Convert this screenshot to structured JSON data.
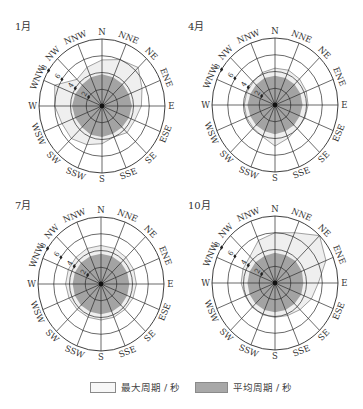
{
  "directions": [
    "N",
    "NNE",
    "NE",
    "ENE",
    "E",
    "ESE",
    "SE",
    "SSE",
    "S",
    "SSW",
    "SW",
    "WSW",
    "W",
    "WNW",
    "NW",
    "NNW"
  ],
  "ring_values": [
    2,
    4,
    6,
    8
  ],
  "colors": {
    "max_fill": "#efefef",
    "max_stroke": "#8a8a8a",
    "avg_fill": "#a3a3a3",
    "grid": "#2a2a2a",
    "legend_max": "#f7f7f7",
    "legend_avg": "#a8a8a8"
  },
  "legend": {
    "max_label": "最大周期 / 秒",
    "avg_label": "平均周期 / 秒"
  },
  "chart_data": [
    {
      "type": "radar",
      "title": "1月",
      "axis": "wave period (s)",
      "rlim": [
        0,
        8
      ],
      "ticks": [
        2,
        4,
        6,
        8
      ],
      "categories": [
        "N",
        "NNE",
        "NE",
        "ENE",
        "E",
        "ESE",
        "SE",
        "SSE",
        "S",
        "SSW",
        "SW",
        "WSW",
        "W",
        "WNW",
        "NW",
        "NNW"
      ],
      "series": [
        {
          "name": "最大周期 / 秒",
          "values": [
            5.5,
            6.0,
            6.5,
            5.5,
            5.0,
            4.5,
            4.5,
            4.0,
            4.5,
            5.0,
            5.5,
            5.5,
            6.0,
            6.5,
            4.5,
            5.0
          ]
        },
        {
          "name": "平均周期 / 秒",
          "values": [
            3.8,
            3.7,
            3.7,
            3.7,
            3.8,
            3.7,
            3.6,
            3.6,
            3.7,
            3.7,
            3.6,
            3.7,
            3.8,
            3.7,
            3.6,
            3.7
          ]
        }
      ]
    },
    {
      "type": "radar",
      "title": "4月",
      "axis": "wave period (s)",
      "rlim": [
        0,
        8
      ],
      "ticks": [
        2,
        4,
        6,
        8
      ],
      "categories": [
        "N",
        "NNE",
        "NE",
        "ENE",
        "E",
        "ESE",
        "SE",
        "SSE",
        "S",
        "SSW",
        "SW",
        "WSW",
        "W",
        "WNW",
        "NW",
        "NNW"
      ],
      "series": [
        {
          "name": "最大周期 / 秒",
          "values": [
            4.4,
            4.5,
            4.4,
            4.3,
            4.2,
            4.1,
            4.0,
            4.3,
            4.9,
            4.1,
            3.9,
            3.9,
            3.9,
            3.9,
            3.9,
            4.2
          ]
        },
        {
          "name": "平均周期 / 秒",
          "values": [
            3.5,
            3.5,
            3.5,
            3.5,
            3.5,
            3.4,
            3.4,
            3.4,
            3.5,
            3.4,
            3.4,
            3.4,
            3.5,
            3.4,
            3.4,
            3.5
          ]
        }
      ]
    },
    {
      "type": "radar",
      "title": "7月",
      "axis": "wave period (s)",
      "rlim": [
        0,
        8
      ],
      "ticks": [
        2,
        4,
        6,
        8
      ],
      "categories": [
        "N",
        "NNE",
        "NE",
        "ENE",
        "E",
        "ESE",
        "SE",
        "SSE",
        "S",
        "SSW",
        "SW",
        "WSW",
        "W",
        "WNW",
        "NW",
        "NNW"
      ],
      "series": [
        {
          "name": "最大周期 / 秒",
          "values": [
            4.6,
            4.6,
            4.5,
            4.5,
            4.5,
            4.4,
            4.3,
            4.3,
            4.3,
            4.3,
            4.3,
            4.4,
            4.5,
            4.5,
            4.5,
            4.6
          ]
        },
        {
          "name": "平均周期 / 秒",
          "values": [
            3.6,
            3.6,
            3.6,
            3.6,
            3.6,
            3.6,
            3.6,
            3.6,
            3.6,
            3.6,
            3.6,
            3.6,
            3.6,
            3.6,
            3.6,
            3.6
          ]
        }
      ]
    },
    {
      "type": "radar",
      "title": "10月",
      "axis": "wave period (s)",
      "rlim": [
        0,
        8
      ],
      "ticks": [
        2,
        4,
        6,
        8
      ],
      "categories": [
        "N",
        "NNE",
        "NE",
        "ENE",
        "E",
        "ESE",
        "SE",
        "SSE",
        "S",
        "SSW",
        "SW",
        "WSW",
        "W",
        "WNW",
        "NW",
        "NNW"
      ],
      "series": [
        {
          "name": "最大周期 / 秒",
          "values": [
            6.0,
            6.5,
            8.0,
            7.0,
            5.5,
            5.0,
            4.5,
            4.2,
            4.1,
            4.1,
            4.1,
            4.1,
            4.3,
            4.4,
            4.5,
            5.5
          ]
        },
        {
          "name": "平均周期 / 秒",
          "values": [
            3.6,
            3.6,
            3.7,
            3.7,
            3.6,
            3.6,
            3.5,
            3.5,
            3.5,
            3.5,
            3.5,
            3.5,
            3.5,
            3.5,
            3.5,
            3.5
          ]
        }
      ]
    }
  ]
}
